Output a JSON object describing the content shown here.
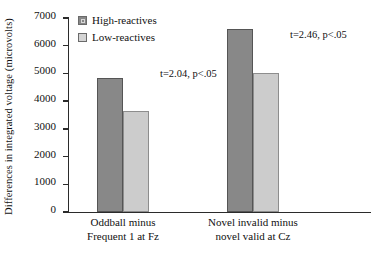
{
  "chart_data": {
    "type": "bar",
    "title": "",
    "xlabel": "",
    "ylabel": "Differences in integrated voltage (microvolts)",
    "categories": [
      "Oddball minus\nFrequent 1 at Fz",
      "Novel invalid minus\nnovel valid at Cz"
    ],
    "category_lines": [
      {
        "line1": "Oddball minus",
        "line2": "Frequent 1 at Fz"
      },
      {
        "line1": "Novel invalid minus",
        "line2": "novel valid at Cz"
      }
    ],
    "series": [
      {
        "name": "High-reactives",
        "color": "#888888",
        "values": [
          4850,
          6600
        ]
      },
      {
        "name": "Low-reactives",
        "color": "#cccccc",
        "values": [
          3650,
          5000
        ]
      }
    ],
    "ylim": [
      0,
      7000
    ],
    "yticks": [
      0,
      1000,
      2000,
      3000,
      4000,
      5000,
      6000,
      7000
    ],
    "ytick_labels": [
      "0",
      "1000",
      "2000",
      "3000",
      "4000",
      "5000",
      "6000",
      "7000"
    ],
    "grid": false,
    "legend_position": "upper-center-left",
    "annotations": [
      {
        "text": "t=2.04, p<.05",
        "group": 0
      },
      {
        "text": "t=2.46, p<.05",
        "group": 1
      }
    ]
  },
  "legend": {
    "items": [
      {
        "label": "High-reactives",
        "swatch": "dark-gray-square"
      },
      {
        "label": "Low-reactives",
        "swatch": "light-gray-square"
      }
    ]
  },
  "axis": {
    "y_title": "Differences in integrated voltage (microvolts)"
  }
}
